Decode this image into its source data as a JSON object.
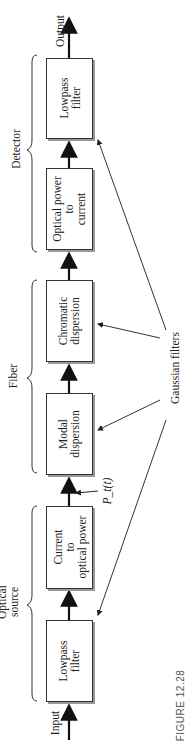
{
  "figure": {
    "caption": "FIGURE 12.28",
    "input_label": "Input",
    "output_label": "Output",
    "signal_label": "P_t(t)",
    "groups": {
      "detector": "Detector",
      "fiber": "Fiber",
      "source_line1": "Optical",
      "source_line2": "source"
    },
    "annotation": "Gaussian filters",
    "blocks": [
      {
        "line1": "Lowpass",
        "line2": "filter",
        "line3": ""
      },
      {
        "line1": "Current",
        "line2": "to",
        "line3": "optical power"
      },
      {
        "line1": "Modal",
        "line2": "dispersion",
        "line3": ""
      },
      {
        "line1": "Chromatic",
        "line2": "dispersion",
        "line3": ""
      },
      {
        "line1": "Optical power",
        "line2": "to",
        "line3": "current"
      },
      {
        "line1": "Lowpass",
        "line2": "filter",
        "line3": ""
      }
    ]
  }
}
